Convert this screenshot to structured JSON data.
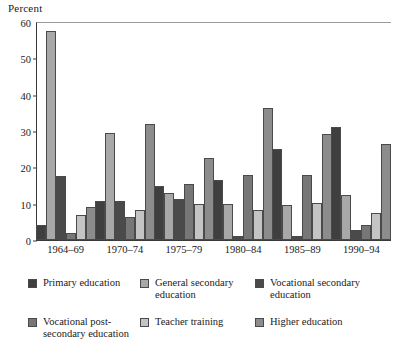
{
  "chart_data": {
    "type": "bar",
    "title": "",
    "ylabel": "Percent",
    "xlabel": "",
    "ylim": [
      0,
      60
    ],
    "yticks": [
      0,
      10,
      20,
      30,
      40,
      50,
      60
    ],
    "grid": false,
    "legend_position": "bottom",
    "categories": [
      "1964–69",
      "1970–74",
      "1975–79",
      "1980–84",
      "1985–89",
      "1990–94"
    ],
    "series": [
      {
        "name": "Primary education",
        "color": "#3f3f3f",
        "values": [
          4.0,
          10.7,
          14.8,
          16.5,
          25.0,
          31.0
        ]
      },
      {
        "name": "General secondary\neducation",
        "color": "#a8a8a8",
        "values": [
          57.5,
          29.5,
          13.0,
          9.8,
          9.7,
          12.5
        ]
      },
      {
        "name": "Vocational secondary\neducation",
        "color": "#4a4a4a",
        "values": [
          17.5,
          10.8,
          11.3,
          1.2,
          1.0,
          2.7
        ]
      },
      {
        "name": "Vocational post-\nsecondary education",
        "color": "#777777",
        "values": [
          2.0,
          6.3,
          15.3,
          17.8,
          17.8,
          4.0
        ]
      },
      {
        "name": "Teacher training",
        "color": "#c4c4c4",
        "values": [
          7.0,
          8.2,
          10.0,
          8.2,
          10.2,
          7.5
        ]
      },
      {
        "name": "Higher education",
        "color": "#8c8c8c",
        "values": [
          9.2,
          32.0,
          22.6,
          36.2,
          29.2,
          26.5
        ]
      }
    ]
  },
  "legend": {
    "items": [
      {
        "label": "Primary education"
      },
      {
        "label": "General secondary\neducation"
      },
      {
        "label": "Vocational secondary\neducation"
      },
      {
        "label": "Vocational post-\nsecondary education"
      },
      {
        "label": "Teacher training"
      },
      {
        "label": "Higher education"
      }
    ]
  }
}
